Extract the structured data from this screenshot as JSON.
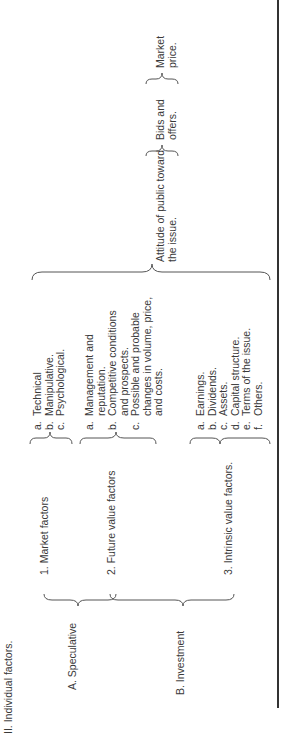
{
  "heading": "II. Individual factors.",
  "categories": [
    {
      "label": "A. Speculative"
    },
    {
      "label": "B. Investment"
    }
  ],
  "factors": [
    {
      "label": "1. Market factors",
      "items": [
        {
          "letter": "a.",
          "text": "Technical"
        },
        {
          "letter": "b.",
          "text": "Manipulative."
        },
        {
          "letter": "c.",
          "text": "Psychological."
        }
      ]
    },
    {
      "label": "2. Future value factors",
      "items": [
        {
          "letter": "a.",
          "text": "Management and reputation."
        },
        {
          "letter": "b.",
          "text": "Competitive conditions and prospects."
        },
        {
          "letter": "c.",
          "text": "Possible and probable changes in volume, price, and costs."
        }
      ]
    },
    {
      "label": "3. Intrinsic value factors.",
      "items": [
        {
          "letter": "a.",
          "text": "Earnings."
        },
        {
          "letter": "b.",
          "text": "Dividends."
        },
        {
          "letter": "c.",
          "text": "Assets."
        },
        {
          "letter": "d.",
          "text": "Capital structure."
        },
        {
          "letter": "e.",
          "text": "Terms of the issue."
        },
        {
          "letter": "f.",
          "text": "Others."
        }
      ]
    }
  ],
  "flow": [
    "Attitude of public toward the issue.",
    "Bids and offers.",
    "Market price."
  ]
}
